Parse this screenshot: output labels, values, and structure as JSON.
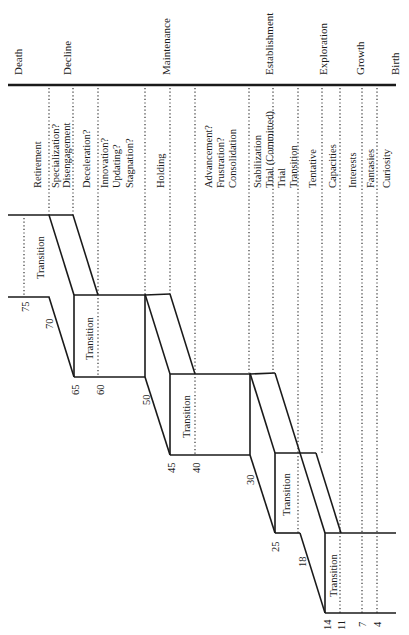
{
  "diagram": {
    "orientation": "rotated-90-counterclockwise",
    "stages": [
      {
        "label": "Death",
        "x": 18
      },
      {
        "label": "Decline",
        "x": 87
      },
      {
        "label": "Maintenance",
        "x": 236
      },
      {
        "label": "Establishment",
        "x": 336
      },
      {
        "label": "Exploration",
        "x": 349
      },
      {
        "label": "Growth",
        "x": 376
      },
      {
        "label": "Birth",
        "x": 395
      }
    ],
    "substages": [
      {
        "label": "Retirement",
        "x": 37
      },
      {
        "label": "Specialization?",
        "x": 55
      },
      {
        "label": "Disengagement",
        "x": 67
      },
      {
        "label": "Deceleration?",
        "x": 86
      },
      {
        "label": "Innovation?",
        "x": 105
      },
      {
        "label": "Updating?",
        "x": 117
      },
      {
        "label": "Stagnation?",
        "x": 130
      },
      {
        "label": "Holding",
        "x": 160
      },
      {
        "label": "Advancement?",
        "x": 208
      },
      {
        "label": "Frustration?",
        "x": 221
      },
      {
        "label": "Consolidation",
        "x": 233
      },
      {
        "label": "Stabilization",
        "x": 258
      },
      {
        "label": "Trial (Committed)",
        "x": 270
      },
      {
        "label": "Trial",
        "x": 282
      },
      {
        "label": "Transition",
        "x": 294
      },
      {
        "label": "Tentative",
        "x": 313
      },
      {
        "label": "Capacities",
        "x": 333
      },
      {
        "label": "Interests",
        "x": 353
      },
      {
        "label": "Fantasies",
        "x": 371
      },
      {
        "label": "Curiosity",
        "x": 387
      }
    ],
    "transitions": [
      {
        "label": "Transition",
        "x": 44,
        "y": 256
      },
      {
        "label": "Transition",
        "x": 93,
        "y": 336
      },
      {
        "label": "Transition",
        "x": 190,
        "y": 415
      },
      {
        "label": "Transition",
        "x": 290,
        "y": 493
      },
      {
        "label": "Transition",
        "x": 337,
        "y": 573
      }
    ],
    "ages": [
      {
        "label": "75",
        "x": 27,
        "y": 306
      },
      {
        "label": "70",
        "x": 51,
        "y": 323
      },
      {
        "label": "65",
        "x": 77,
        "y": 390
      },
      {
        "label": "60",
        "x": 102,
        "y": 390
      },
      {
        "label": "50",
        "x": 148,
        "y": 400
      },
      {
        "label": "45",
        "x": 173,
        "y": 468
      },
      {
        "label": "40",
        "x": 198,
        "y": 468
      },
      {
        "label": "30",
        "x": 252,
        "y": 480
      },
      {
        "label": "25",
        "x": 277,
        "y": 547
      },
      {
        "label": "18",
        "x": 304,
        "y": 562
      },
      {
        "label": "14",
        "x": 329,
        "y": 625
      },
      {
        "label": "11",
        "x": 343,
        "y": 625
      },
      {
        "label": "7",
        "x": 364,
        "y": 625
      },
      {
        "label": "4",
        "x": 379,
        "y": 625
      }
    ]
  }
}
